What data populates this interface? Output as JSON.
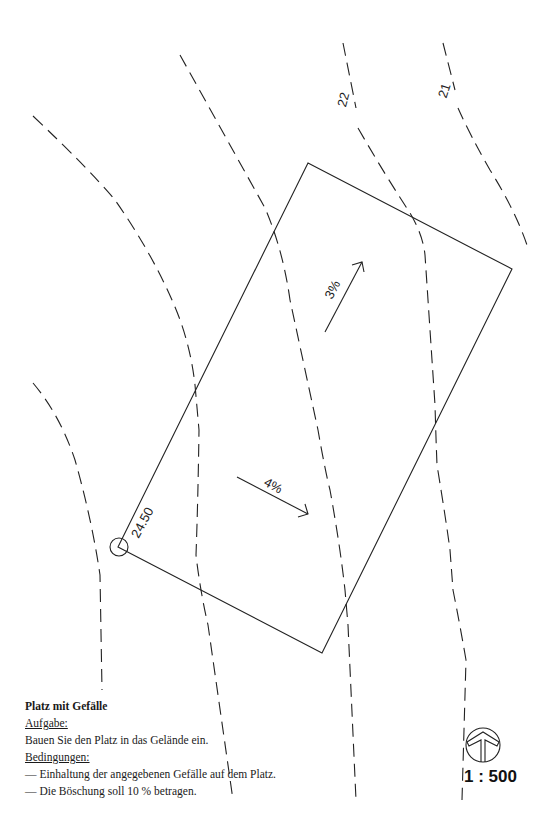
{
  "drawing": {
    "contours": [
      {
        "label": "22"
      },
      {
        "label": "21"
      }
    ],
    "corner_elevation": "24.50",
    "slopes": [
      {
        "label": "3%"
      },
      {
        "label": "4%"
      }
    ],
    "scale": "1 : 500",
    "north_arrow": "north-arrow-icon"
  },
  "task": {
    "title": "Platz mit Gefälle",
    "task_heading": "Aufgabe:",
    "task_text": "Bauen Sie den Platz in das Gelände ein.",
    "conditions_heading": "Bedingungen:",
    "conditions": [
      "— Einhaltung der angegebenen Gefälle auf dem Platz.",
      "— Die Böschung soll 10 % betragen."
    ]
  },
  "colors": {
    "line": "#222222",
    "background": "#ffffff"
  }
}
